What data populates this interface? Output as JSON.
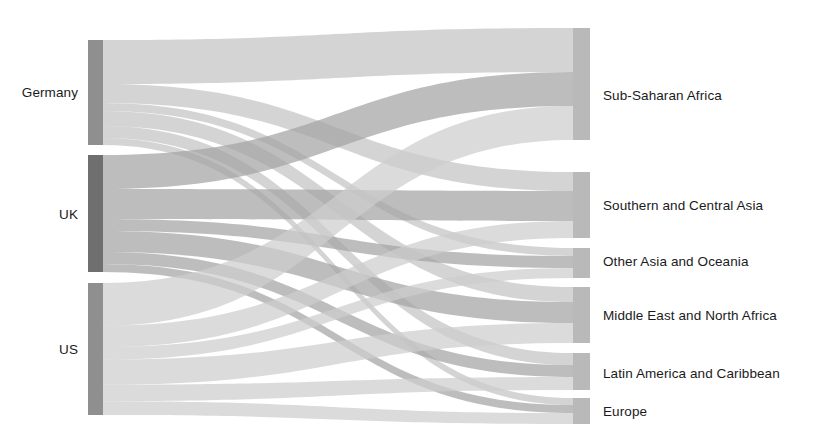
{
  "chart_data": {
    "type": "sankey",
    "title": "",
    "subtitle": "",
    "xlabel": "",
    "ylabel": "",
    "legend_position": "none",
    "grid": false,
    "orientation": "left-to-right",
    "source_nodes": [
      {
        "id": "germany",
        "label": "Germany",
        "total": 105
      },
      {
        "id": "uk",
        "label": "UK",
        "total": 117
      },
      {
        "id": "us",
        "label": "US",
        "total": 132
      }
    ],
    "target_nodes": [
      {
        "id": "ssa",
        "label": "Sub-Saharan Africa",
        "total": 112
      },
      {
        "id": "sca",
        "label": "Southern and Central Asia",
        "total": 66
      },
      {
        "id": "oao",
        "label": "Other Asia and Oceania",
        "total": 30
      },
      {
        "id": "mena",
        "label": "Middle East and North Africa",
        "total": 56
      },
      {
        "id": "lac",
        "label": "Latin America and Caribbean",
        "total": 37
      },
      {
        "id": "eur",
        "label": "Europe",
        "total": 26
      }
    ],
    "links": [
      {
        "source": "germany",
        "target": "ssa",
        "value": 44
      },
      {
        "source": "germany",
        "target": "sca",
        "value": 19
      },
      {
        "source": "germany",
        "target": "oao",
        "value": 8
      },
      {
        "source": "germany",
        "target": "mena",
        "value": 15
      },
      {
        "source": "germany",
        "target": "lac",
        "value": 12
      },
      {
        "source": "germany",
        "target": "eur",
        "value": 7
      },
      {
        "source": "uk",
        "target": "ssa",
        "value": 34
      },
      {
        "source": "uk",
        "target": "sca",
        "value": 30
      },
      {
        "source": "uk",
        "target": "oao",
        "value": 12
      },
      {
        "source": "uk",
        "target": "mena",
        "value": 21
      },
      {
        "source": "uk",
        "target": "lac",
        "value": 12
      },
      {
        "source": "uk",
        "target": "eur",
        "value": 8
      },
      {
        "source": "us",
        "target": "ssa",
        "value": 34
      },
      {
        "source": "us",
        "target": "sca",
        "value": 17
      },
      {
        "source": "us",
        "target": "oao",
        "value": 10
      },
      {
        "source": "us",
        "target": "mena",
        "value": 20
      },
      {
        "source": "us",
        "target": "lac",
        "value": 13
      },
      {
        "source": "us",
        "target": "eur",
        "value": 11
      }
    ]
  },
  "colors": {
    "node_left": "#8f8f8f",
    "node_left_uk": "#6f6f6f",
    "node_right": "#b9b9b9",
    "node_edge": "#c9c9c9",
    "flow_germany": "#c3c3c3",
    "flow_uk": "#a3a3a3",
    "flow_us": "#cdcdcd",
    "label_text": "#1b1b1b",
    "background": "#ffffff"
  },
  "labels": {
    "left": [
      {
        "name": "germany",
        "text": "Germany",
        "x": 78,
        "y": 92
      },
      {
        "name": "uk",
        "text": "UK",
        "x": 78,
        "y": 214
      },
      {
        "name": "us",
        "text": "US",
        "x": 78,
        "y": 349
      }
    ],
    "right": [
      {
        "name": "sub-saharan-africa",
        "text": "Sub-Saharan Africa",
        "x": 603,
        "y": 95
      },
      {
        "name": "southern-and-central-asia",
        "text": "Southern and Central Asia",
        "x": 603,
        "y": 205
      },
      {
        "name": "other-asia-and-oceania",
        "text": "Other Asia and Oceania",
        "x": 603,
        "y": 261
      },
      {
        "name": "middle-east-and-north-africa",
        "text": "Middle East and North Africa",
        "x": 603,
        "y": 315
      },
      {
        "name": "latin-america-and-caribbean",
        "text": "Latin America and Caribbean",
        "x": 603,
        "y": 373
      },
      {
        "name": "europe",
        "text": "Europe",
        "x": 603,
        "y": 411
      }
    ]
  },
  "geometry": {
    "left_node_x": 88,
    "left_node_width": 15,
    "right_node_x": 573,
    "right_node_width": 17,
    "flow_start_x": 103,
    "flow_end_x": 573,
    "left_nodes": [
      {
        "id": "germany",
        "y0": 40,
        "y1": 145
      },
      {
        "id": "uk",
        "y0": 155,
        "y1": 272
      },
      {
        "id": "us",
        "y0": 283,
        "y1": 415
      }
    ],
    "right_nodes": [
      {
        "id": "ssa",
        "y0": 28,
        "y1": 140
      },
      {
        "id": "sca",
        "y0": 172,
        "y1": 238
      },
      {
        "id": "oao",
        "y0": 248,
        "y1": 278
      },
      {
        "id": "mena",
        "y0": 287,
        "y1": 343
      },
      {
        "id": "lac",
        "y0": 353,
        "y1": 390
      },
      {
        "id": "eur",
        "y0": 398,
        "y1": 424
      }
    ]
  }
}
